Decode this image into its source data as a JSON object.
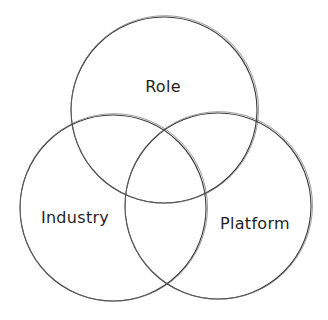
{
  "diagram": {
    "type": "venn",
    "style": "hand-drawn sketch",
    "background": "#ffffff",
    "stroke_color": "#3a3a3a",
    "text_color": "#1f1f1f",
    "sets": [
      {
        "id": "role",
        "label": "Role",
        "cx": 164,
        "cy": 110,
        "r": 93,
        "label_x": 163,
        "label_y": 92
      },
      {
        "id": "industry",
        "label": "Industry",
        "cx": 113,
        "cy": 208,
        "r": 93,
        "label_x": 75,
        "label_y": 223
      },
      {
        "id": "platform",
        "label": "Platform",
        "cx": 218,
        "cy": 206,
        "r": 93,
        "label_x": 255,
        "label_y": 229
      }
    ],
    "intersections": [
      {
        "sets": [
          "role",
          "industry"
        ]
      },
      {
        "sets": [
          "role",
          "platform"
        ]
      },
      {
        "sets": [
          "industry",
          "platform"
        ]
      },
      {
        "sets": [
          "role",
          "industry",
          "platform"
        ]
      }
    ]
  }
}
